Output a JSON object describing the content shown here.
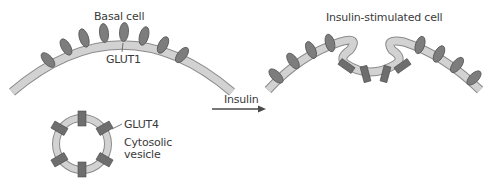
{
  "diagram": {
    "left_panel": {
      "title": "Basal cell",
      "membrane_protein_label": "GLUT1",
      "vesicle_protein_label": "GLUT4",
      "vesicle_label_line1": "Cytosolic",
      "vesicle_label_line2": "vesicle"
    },
    "arrow": {
      "label": "Insulin"
    },
    "right_panel": {
      "title": "Insulin-stimulated cell"
    },
    "colors": {
      "membrane_fill": "#cfcfcf",
      "membrane_outline": "#8a8a8a",
      "glut1_fill": "#7d7d7d",
      "glut4_fill": "#6e6e6e",
      "text": "#3a3a3a"
    }
  }
}
